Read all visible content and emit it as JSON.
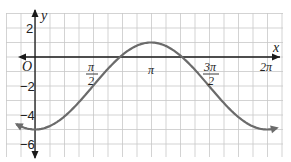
{
  "chart_data": {
    "type": "line",
    "title": "",
    "xlabel": "x",
    "ylabel": "y",
    "origin_label": "O",
    "x_ticks": [
      {
        "value": 1.5708,
        "label_num": "π",
        "label_den": "2"
      },
      {
        "value": 3.1416,
        "label": "π"
      },
      {
        "value": 4.7124,
        "label_num": "3π",
        "label_den": "2"
      },
      {
        "value": 6.2832,
        "label": "2π"
      }
    ],
    "y_ticks": [
      {
        "value": 2,
        "label": "2"
      },
      {
        "value": -2,
        "label": "−2"
      },
      {
        "value": -4,
        "label": "−4"
      },
      {
        "value": -6,
        "label": "−6"
      }
    ],
    "function": "y = -3cos(x) - 2",
    "xlim": [
      -0.7,
      6.6
    ],
    "ylim": [
      -6.8,
      3.2
    ],
    "grid": true,
    "series": [
      {
        "name": "curve",
        "color": "#6b6b6b",
        "x": [
          -0.6,
          0,
          0.7854,
          1.5708,
          2.3562,
          3.1416,
          3.927,
          4.7124,
          5.4978,
          6.2832,
          6.5
        ],
        "values": [
          -4.48,
          -5,
          -4.12,
          -2,
          0.12,
          1,
          0.12,
          -2,
          -4.12,
          -5,
          -4.93
        ]
      }
    ]
  },
  "labels": {
    "x_axis": "x",
    "y_axis": "y",
    "origin": "O",
    "y2": "2",
    "ym2": "−2",
    "ym4": "−4",
    "ym6": "−6",
    "pi_half_num": "π",
    "pi_half_den": "2",
    "pi": "π",
    "three_pi_half_num": "3π",
    "three_pi_half_den": "2",
    "two_pi": "2π"
  },
  "colors": {
    "grid": "#c8c8c8",
    "axis": "#1a1a1a",
    "curve": "#6b6b6b"
  }
}
